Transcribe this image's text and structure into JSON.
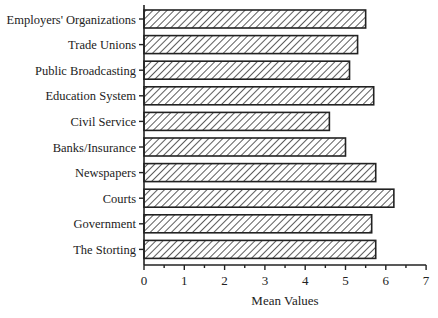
{
  "chart_data": {
    "type": "bar",
    "orientation": "horizontal",
    "title": "",
    "xlabel": "Mean Values",
    "ylabel": "",
    "xlim": [
      0,
      7
    ],
    "xticks": [
      0,
      1,
      2,
      3,
      4,
      5,
      6,
      7
    ],
    "grid": false,
    "legend": null,
    "bar_fill": "diagonal hatch",
    "categories": [
      "Employers' Organizations",
      "Trade Unions",
      "Public Broadcasting",
      "Education System",
      "Civil Service",
      "Banks/Insurance",
      "Newspapers",
      "Courts",
      "Government",
      "The Storting"
    ],
    "values": [
      5.5,
      5.3,
      5.1,
      5.7,
      4.6,
      5.0,
      5.75,
      6.2,
      5.65,
      5.75
    ]
  },
  "colors": {
    "ink": "#222222",
    "hatch": "#333333",
    "background": "#ffffff"
  }
}
